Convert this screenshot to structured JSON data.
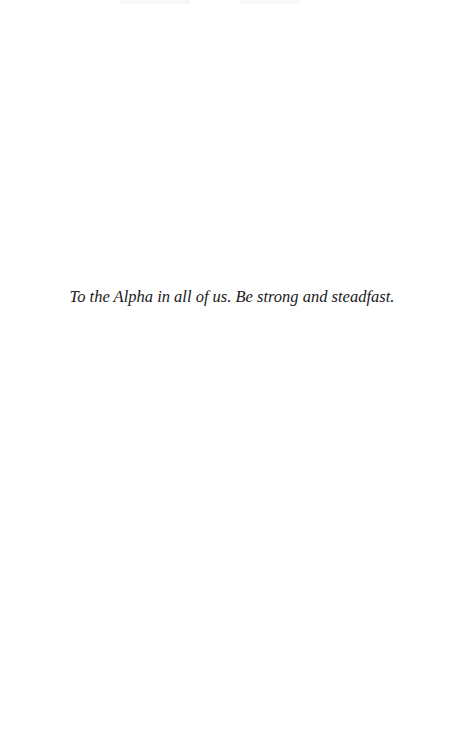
{
  "page": {
    "dedication": "To the Alpha in all of us. Be strong and steadfast."
  }
}
